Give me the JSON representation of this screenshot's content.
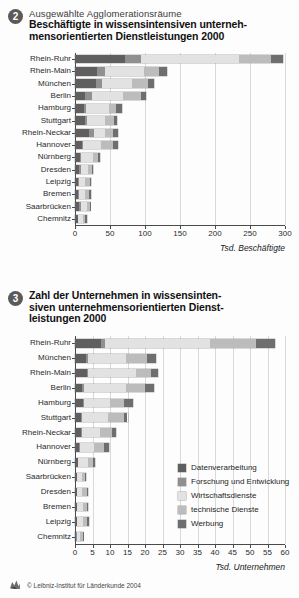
{
  "legend": {
    "items": [
      {
        "label": "Datenverarbeitung",
        "color": "#5f5f5f"
      },
      {
        "label": "Forschung und Entwicklung",
        "color": "#909090"
      },
      {
        "label": "Wirtschaftsdienste",
        "color": "#e2e2e2"
      },
      {
        "label": "technische Dienste",
        "color": "#bcbcbc"
      },
      {
        "label": "Werbung",
        "color": "#6e6e6e"
      }
    ]
  },
  "footer": {
    "copyright": "© Leibniz-Institut für Länderkunde 2004",
    "logo_icon": "leibniz-logo-icon"
  },
  "panel1": {
    "number": "2",
    "subtitle": "Ausgewählte Agglomerationsräume",
    "title_line1": "Beschäftigte in wissensintensiven unterneh-",
    "title_line2": "mensorientierten Dienstleistungen 2000"
  },
  "panel2": {
    "number": "3",
    "title_line1": "Zahl der Unternehmen in wissensinten-",
    "title_line2": "siven unternehmensorientierten Dienst-",
    "title_line3": "leistungen 2000"
  },
  "chart_data": [
    {
      "type": "bar",
      "orientation": "horizontal",
      "stacked": true,
      "title": "Beschäftigte in wissensintensiven unternehmensorientierten Dienstleistungen 2000",
      "subtitle": "Ausgewählte Agglomerationsräume",
      "xlabel": "Tsd. Beschäftigte",
      "ylabel": "",
      "xlim": [
        0,
        300
      ],
      "xticks": [
        0,
        50,
        100,
        150,
        200,
        250,
        300
      ],
      "grid": true,
      "legend_position": "none",
      "categories": [
        "Rhein-Ruhr",
        "Rhein-Main",
        "München",
        "Berlin",
        "Hamburg",
        "Stuttgart",
        "Rhein-Neckar",
        "Hannover",
        "Nürnberg",
        "Dresden",
        "Leipzig",
        "Bremen",
        "Saarbrücken",
        "Chemnitz"
      ],
      "series": [
        {
          "name": "Datenverarbeitung",
          "color": "#5f5f5f",
          "values": [
            72,
            32,
            30,
            14,
            13,
            14,
            20,
            10,
            7,
            6,
            4,
            4,
            6,
            4
          ]
        },
        {
          "name": "Forschung und Entwicklung",
          "color": "#909090",
          "values": [
            23,
            11,
            9,
            10,
            3,
            3,
            7,
            2,
            2,
            2,
            2,
            2,
            2,
            1
          ]
        },
        {
          "name": "Wirtschaftsdienste",
          "color": "#e2e2e2",
          "values": [
            140,
            55,
            43,
            45,
            32,
            26,
            16,
            25,
            17,
            10,
            9,
            8,
            9,
            6
          ]
        },
        {
          "name": "technische Dienste",
          "color": "#bcbcbc",
          "values": [
            45,
            22,
            22,
            25,
            10,
            13,
            12,
            17,
            7,
            6,
            6,
            6,
            4,
            4
          ]
        },
        {
          "name": "Werbung",
          "color": "#6e6e6e",
          "values": [
            17,
            12,
            9,
            8,
            9,
            4,
            6,
            8,
            3,
            2,
            2,
            3,
            1,
            2
          ]
        }
      ]
    },
    {
      "type": "bar",
      "orientation": "horizontal",
      "stacked": true,
      "title": "Zahl der Unternehmen in wissensintensiven unternehmensorientierten Dienstleistungen 2000",
      "xlabel": "Tsd. Unternehmen",
      "ylabel": "",
      "xlim": [
        0,
        60
      ],
      "xticks": [
        0,
        5,
        10,
        15,
        20,
        25,
        30,
        35,
        40,
        45,
        50,
        55,
        60
      ],
      "grid": true,
      "legend_position": "right",
      "categories": [
        "Rhein-Ruhr",
        "München",
        "Rhein-Main",
        "Berlin",
        "Hamburg",
        "Stuttgart",
        "Rhein-Neckar",
        "Hannover",
        "Nürnberg",
        "Saarbrücken",
        "Dresden",
        "Bremen",
        "Leipzig",
        "Chemnitz"
      ],
      "series": [
        {
          "name": "Datenverarbeitung",
          "color": "#5f5f5f",
          "values": [
            7.5,
            3.0,
            3.3,
            2.0,
            2.2,
            1.7,
            1.7,
            1.2,
            0.8,
            0.5,
            0.5,
            0.5,
            0.5,
            0.4
          ]
        },
        {
          "name": "Forschung und Entwicklung",
          "color": "#909090",
          "values": [
            1.2,
            0.6,
            0.5,
            0.5,
            0.4,
            0.3,
            0.4,
            0.2,
            0.2,
            0.1,
            0.2,
            0.2,
            0.2,
            0.1
          ]
        },
        {
          "name": "Wirtschaftsdienste",
          "color": "#e2e2e2",
          "values": [
            30.0,
            11.0,
            13.5,
            12.0,
            7.5,
            7.5,
            5.0,
            4.0,
            2.6,
            1.3,
            1.4,
            1.5,
            1.6,
            1.0
          ]
        },
        {
          "name": "technische Dienste",
          "color": "#bcbcbc",
          "values": [
            13.0,
            6.0,
            4.5,
            5.5,
            4.0,
            4.5,
            3.5,
            3.0,
            1.6,
            0.9,
            1.3,
            1.1,
            1.2,
            0.7
          ]
        },
        {
          "name": "Werbung",
          "color": "#6e6e6e",
          "values": [
            5.5,
            2.5,
            2.0,
            2.5,
            2.5,
            1.0,
            1.2,
            1.2,
            0.6,
            0.3,
            0.4,
            0.4,
            0.4,
            0.2
          ]
        }
      ]
    }
  ]
}
